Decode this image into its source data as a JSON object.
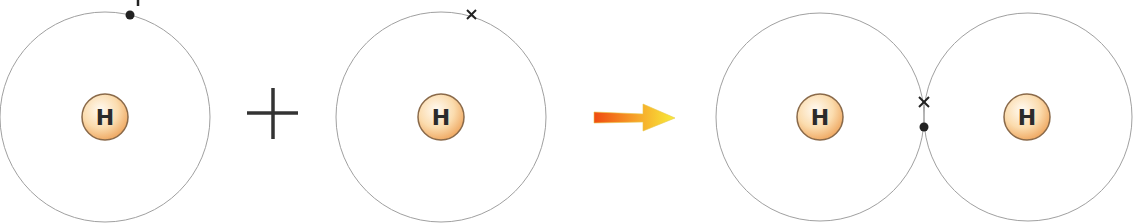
{
  "diagram": {
    "atoms": [
      {
        "id": "atom-1",
        "label": "H",
        "electron": "dot"
      },
      {
        "id": "atom-2",
        "label": "H",
        "electron": "cross"
      },
      {
        "id": "molecule-atom-a",
        "label": "H"
      },
      {
        "id": "molecule-atom-b",
        "label": "H"
      }
    ],
    "operator": "+",
    "shared_pair": [
      "cross",
      "dot"
    ],
    "colors": {
      "shell": "#9a9a9a",
      "nucleus_fill": "#f6c98c",
      "nucleus_stroke": "#8a6a4a",
      "arrow_start": "#f04a10",
      "arrow_end": "#f8ec3a",
      "electron": "#222222"
    }
  }
}
